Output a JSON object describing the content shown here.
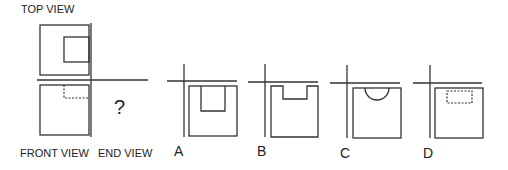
{
  "question": {
    "top_view_label": "TOP VIEW",
    "front_view_label": "FRONT VIEW",
    "end_view_label": "END VIEW",
    "unknown_marker": "?"
  },
  "options": [
    {
      "letter": "A",
      "description": "square with solid inner rectangle cut from top center"
    },
    {
      "letter": "B",
      "description": "square with rectangular notch at top center"
    },
    {
      "letter": "C",
      "description": "square with semicircular notch at top center"
    },
    {
      "letter": "D",
      "description": "square with hidden (dashed) rectangle near top center"
    }
  ],
  "colors": {
    "line": "#333333",
    "text": "#222222",
    "background": "#ffffff"
  }
}
